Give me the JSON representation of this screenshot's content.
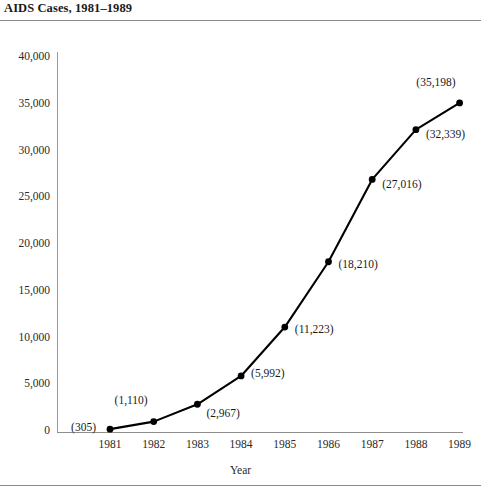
{
  "chart_data": {
    "type": "line",
    "title": "AIDS Cases, 1981–1989",
    "xlabel": "Year",
    "ylabel": "",
    "categories": [
      "1981",
      "1982",
      "1983",
      "1984",
      "1985",
      "1986",
      "1987",
      "1988",
      "1989"
    ],
    "values": [
      305,
      1110,
      2967,
      5992,
      11223,
      18210,
      27016,
      32339,
      35198
    ],
    "point_labels": [
      "(305)",
      "(1,110)",
      "(2,967)",
      "(5,992)",
      "(11,223)",
      "(18,210)",
      "(27,016)",
      "(32,339)",
      "(35,198)"
    ],
    "ylim": [
      0,
      40000
    ],
    "ytick_values": [
      0,
      5000,
      10000,
      15000,
      20000,
      25000,
      30000,
      35000,
      40000
    ],
    "ytick_labels": [
      "0",
      "5,000",
      "10,000",
      "15,000",
      "20,000",
      "25,000",
      "30,000",
      "35,000",
      "40,000"
    ],
    "grid": false,
    "legend": "none",
    "series_color": "#000000",
    "marker": "filled-circle",
    "axis_color": "#8e8e8e"
  },
  "rules": {
    "top_rule": "horizontal-rule-under-title",
    "bottom_rule": "horizontal-rule-bottom"
  }
}
